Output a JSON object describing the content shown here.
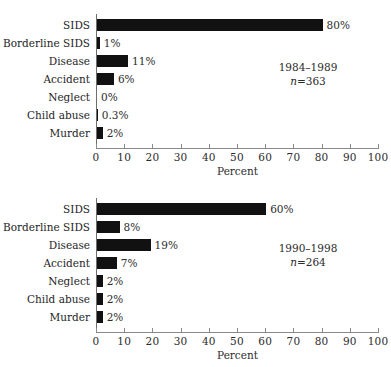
{
  "chart_data": [
    {
      "type": "bar",
      "orientation": "horizontal",
      "title": "",
      "xlabel": "Percent",
      "ylabel": "",
      "xlim": [
        0,
        100
      ],
      "xticks": [
        0,
        10,
        20,
        30,
        40,
        50,
        60,
        70,
        80,
        90,
        100
      ],
      "xticklabels": [
        "0",
        "10",
        "20",
        "30",
        "40",
        "50",
        "60",
        "70",
        "80",
        "90",
        "100"
      ],
      "grid": false,
      "legend": null,
      "categories": [
        "SIDS",
        "Borderline SIDS",
        "Disease",
        "Accident",
        "Neglect",
        "Child abuse",
        "Murder"
      ],
      "values": [
        80,
        1,
        11,
        6,
        0,
        0.3,
        2
      ],
      "data_labels": [
        "80%",
        "1%",
        "11%",
        "6%",
        "0%",
        "0.3%",
        "2%"
      ],
      "annotation": {
        "period": "1984–1989",
        "n_prefix": "n",
        "n_value": "=363"
      }
    },
    {
      "type": "bar",
      "orientation": "horizontal",
      "title": "",
      "xlabel": "Percent",
      "ylabel": "",
      "xlim": [
        0,
        100
      ],
      "xticks": [
        0,
        10,
        20,
        30,
        40,
        50,
        60,
        70,
        80,
        90,
        100
      ],
      "xticklabels": [
        "0",
        "10",
        "20",
        "30",
        "40",
        "50",
        "60",
        "70",
        "80",
        "90",
        "100"
      ],
      "grid": false,
      "legend": null,
      "categories": [
        "SIDS",
        "Borderline SIDS",
        "Disease",
        "Accident",
        "Neglect",
        "Child abuse",
        "Murder"
      ],
      "values": [
        60,
        8,
        19,
        7,
        2,
        2,
        2
      ],
      "data_labels": [
        "60%",
        "8%",
        "19%",
        "7%",
        "2%",
        "2%",
        "2%"
      ],
      "annotation": {
        "period": "1990–1998",
        "n_prefix": "n",
        "n_value": "=264"
      }
    }
  ],
  "style": {
    "bar_color": "#111111",
    "axis_color": "#8a8a8a",
    "text_color": "#1e1e1e",
    "background": "#ffffff"
  }
}
